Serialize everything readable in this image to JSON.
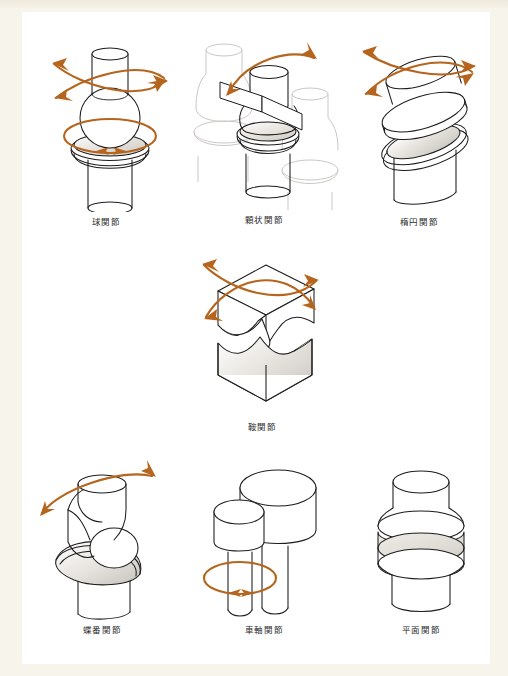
{
  "page": {
    "background_color": "#f7f4ec",
    "plate_color": "#ffffff",
    "ink_color": "#1c1c1c",
    "ghost_color": "#c9c6c1",
    "arrow_color": "#b5651d",
    "shade_color": "#d8d4ce"
  },
  "figures": [
    {
      "id": "ball-and-socket-joint",
      "caption": "球関節",
      "icon": "ball-and-socket-joint-diagram",
      "motion": "multiaxial-rotation",
      "arrows": 2
    },
    {
      "id": "condyloid-joint",
      "caption": "顆状関節",
      "icon": "condyloid-joint-diagram",
      "motion": "biaxial-swing",
      "arrows": 1
    },
    {
      "id": "ellipsoid-joint",
      "caption": "楕円関節",
      "icon": "ellipsoid-joint-diagram",
      "motion": "biaxial-rotation",
      "arrows": 2
    },
    {
      "id": "saddle-joint",
      "caption": "鞍関節",
      "icon": "saddle-joint-diagram",
      "motion": "biaxial-rotation",
      "arrows": 2
    },
    {
      "id": "hinge-joint",
      "caption": "蝶番関節",
      "icon": "hinge-joint-diagram",
      "motion": "uniaxial-swing",
      "arrows": 1
    },
    {
      "id": "pivot-joint",
      "caption": "車軸関節",
      "icon": "pivot-joint-diagram",
      "motion": "axial-rotation",
      "arrows": 1
    },
    {
      "id": "plane-joint",
      "caption": "平面関節",
      "icon": "plane-joint-diagram",
      "motion": "gliding",
      "arrows": 0
    }
  ]
}
